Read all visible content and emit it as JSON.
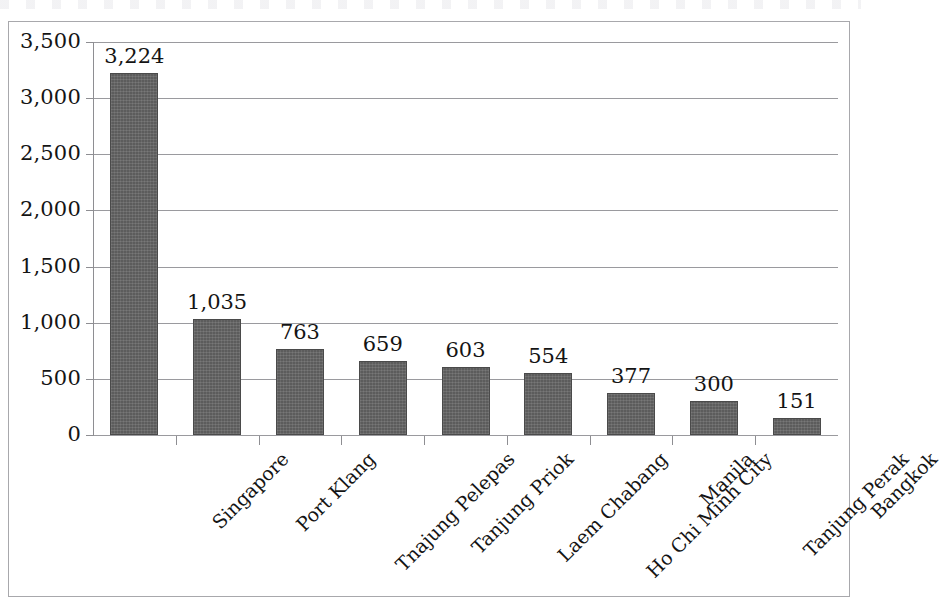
{
  "chart_data": {
    "type": "bar",
    "title": "",
    "subtitle": "",
    "xlabel": "",
    "ylabel": "",
    "ylim": [
      0,
      3500
    ],
    "y_ticks": [
      "0",
      "500",
      "1,000",
      "1,500",
      "2,000",
      "2,500",
      "3,000",
      "3,500"
    ],
    "y_tick_values": [
      0,
      500,
      1000,
      1500,
      2000,
      2500,
      3000,
      3500
    ],
    "grid": "horizontal",
    "legend": "none",
    "categories": [
      "Singapore",
      "Port Klang",
      "Tnajung Pelepas",
      "Tanjung Priok",
      "Laem Chabang",
      "Ho Chi Minh City",
      "Manila",
      "Tanjung Perak",
      "Bangkok"
    ],
    "values": [
      3224,
      1035,
      763,
      659,
      603,
      554,
      377,
      300,
      151
    ],
    "value_labels": [
      "3,224",
      "1,035",
      "763",
      "659",
      "603",
      "554",
      "377",
      "300",
      "151"
    ],
    "bar_color": "#5c5c5c",
    "frame_color": "#a8a8ac",
    "gridline_color": "#9a9a9e"
  }
}
